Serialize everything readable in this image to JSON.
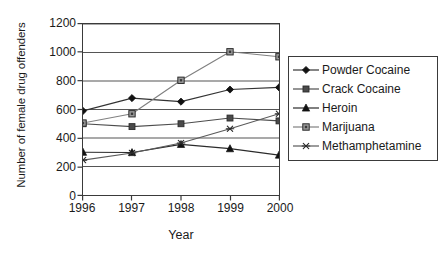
{
  "chart_data": {
    "type": "line",
    "title": "",
    "xlabel": "Year",
    "ylabel": "Number of female drug offenders",
    "categories": [
      "1996",
      "1997",
      "1998",
      "1999",
      "2000"
    ],
    "xlim": [
      1996,
      2000
    ],
    "ylim": [
      0,
      1200
    ],
    "y_ticks": [
      "0",
      "200",
      "400",
      "600",
      "800",
      "1000",
      "1200"
    ],
    "grid": "horizontal",
    "legend_position": "right",
    "series": [
      {
        "name": "Powder Cocaine",
        "marker": "diamond",
        "color": "#333333",
        "values": [
          590,
          680,
          655,
          740,
          755
        ]
      },
      {
        "name": "Crack Cocaine",
        "marker": "filled-square",
        "color": "#4d4d4d",
        "values": [
          500,
          480,
          500,
          540,
          520
        ]
      },
      {
        "name": "Heroin",
        "marker": "triangle",
        "color": "#2b2b2b",
        "values": [
          300,
          298,
          355,
          325,
          280
        ]
      },
      {
        "name": "Marijuana",
        "marker": "outlined-square",
        "color": "#808080",
        "values": [
          505,
          570,
          805,
          1005,
          970
        ]
      },
      {
        "name": "Methamphetamine",
        "marker": "asterisk",
        "color": "#5a5a5a",
        "values": [
          245,
          295,
          365,
          465,
          570
        ]
      }
    ]
  },
  "legend": {
    "entries": [
      {
        "label": "Powder Cocaine"
      },
      {
        "label": "Crack Cocaine"
      },
      {
        "label": "Heroin"
      },
      {
        "label": "Marijuana"
      },
      {
        "label": "Methamphetamine"
      }
    ]
  },
  "colors": {
    "axis": "#3a3a3a",
    "grid": "#555555",
    "background": "#ffffff",
    "text": "#1a1a1a"
  }
}
